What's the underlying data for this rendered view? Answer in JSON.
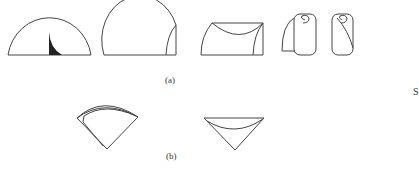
{
  "figure": {
    "panels": [
      {
        "id": "a",
        "label": "(a)",
        "shapes": [
          {
            "name": "semicircle-with-dark-wedge"
          },
          {
            "name": "semicircle-with-folded-edge"
          },
          {
            "name": "rectangle-with-curved-fold"
          },
          {
            "name": "rolled-sheet-open"
          },
          {
            "name": "rolled-sheet-closed"
          }
        ]
      },
      {
        "id": "b",
        "label": "(b)",
        "shapes": [
          {
            "name": "sector-fan-layered"
          },
          {
            "name": "inverted-triangle-cone"
          }
        ]
      }
    ],
    "edge_fragment": "S"
  },
  "colors": {
    "stroke": "#444444",
    "fill_dark": "#222222",
    "background": "#ffffff"
  }
}
